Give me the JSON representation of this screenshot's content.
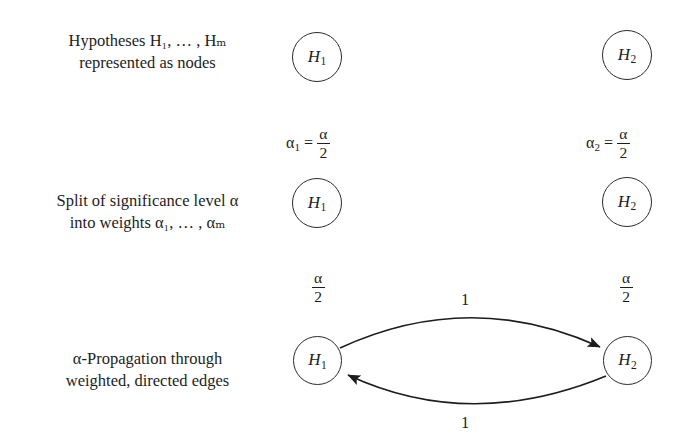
{
  "diagram": {
    "background": "#ffffff",
    "stroke_color": "#2a2a2a",
    "text_color": "#1d1d1d"
  },
  "rows": [
    {
      "id": "hypotheses",
      "label_line1": "Hypotheses H₁, … , Hₘ",
      "label_line2": "represented as nodes"
    },
    {
      "id": "split",
      "label_line1": "Split of significance level α",
      "label_line2": "into weights α₁, … , αₘ"
    },
    {
      "id": "propagation",
      "label_line1": "α-Propagation through",
      "label_line2": "weighted, directed edges"
    }
  ],
  "nodes": {
    "h1": {
      "letter": "H",
      "sub": "1"
    },
    "h2": {
      "letter": "H",
      "sub": "2"
    }
  },
  "weights": {
    "alpha1_eq": {
      "symbol": "α",
      "sub": "1",
      "relation": "=",
      "num": "α",
      "den": "2"
    },
    "alpha2_eq": {
      "symbol": "α",
      "sub": "2",
      "relation": "=",
      "num": "α",
      "den": "2"
    },
    "alpha_half_left": {
      "num": "α",
      "den": "2"
    },
    "alpha_half_right": {
      "num": "α",
      "den": "2"
    }
  },
  "edges": [
    {
      "id": "h1-to-h2",
      "weight": "1",
      "direction": "H1→H2",
      "position": "top"
    },
    {
      "id": "h2-to-h1",
      "weight": "1",
      "direction": "H2→H1",
      "position": "bottom"
    }
  ]
}
